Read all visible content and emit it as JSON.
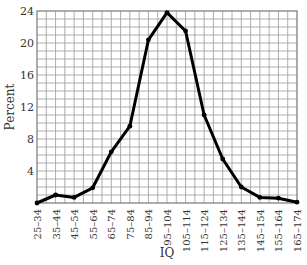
{
  "chart_data": {
    "type": "line",
    "title": "",
    "xlabel": "IQ",
    "ylabel": "Percent",
    "categories": [
      "25–34",
      "35–44",
      "45–54",
      "55–64",
      "65–74",
      "75–84",
      "85–94",
      "95–104",
      "105–114",
      "115–124",
      "125–134",
      "135–144",
      "145–154",
      "155–164",
      "165–174"
    ],
    "series": [
      {
        "name": "Percent",
        "values": [
          0.0,
          1.0,
          0.7,
          1.9,
          6.4,
          9.6,
          20.4,
          23.8,
          21.5,
          11.0,
          5.5,
          2.0,
          0.7,
          0.6,
          0.1
        ]
      }
    ],
    "ylim": [
      0,
      24
    ],
    "yticks": [
      4,
      8,
      12,
      16,
      20,
      24
    ],
    "grid": true,
    "legend": null
  },
  "colors": {
    "line": "#000000",
    "grid": "#9a9a9a",
    "frame": "#777777",
    "text": "#333333"
  }
}
